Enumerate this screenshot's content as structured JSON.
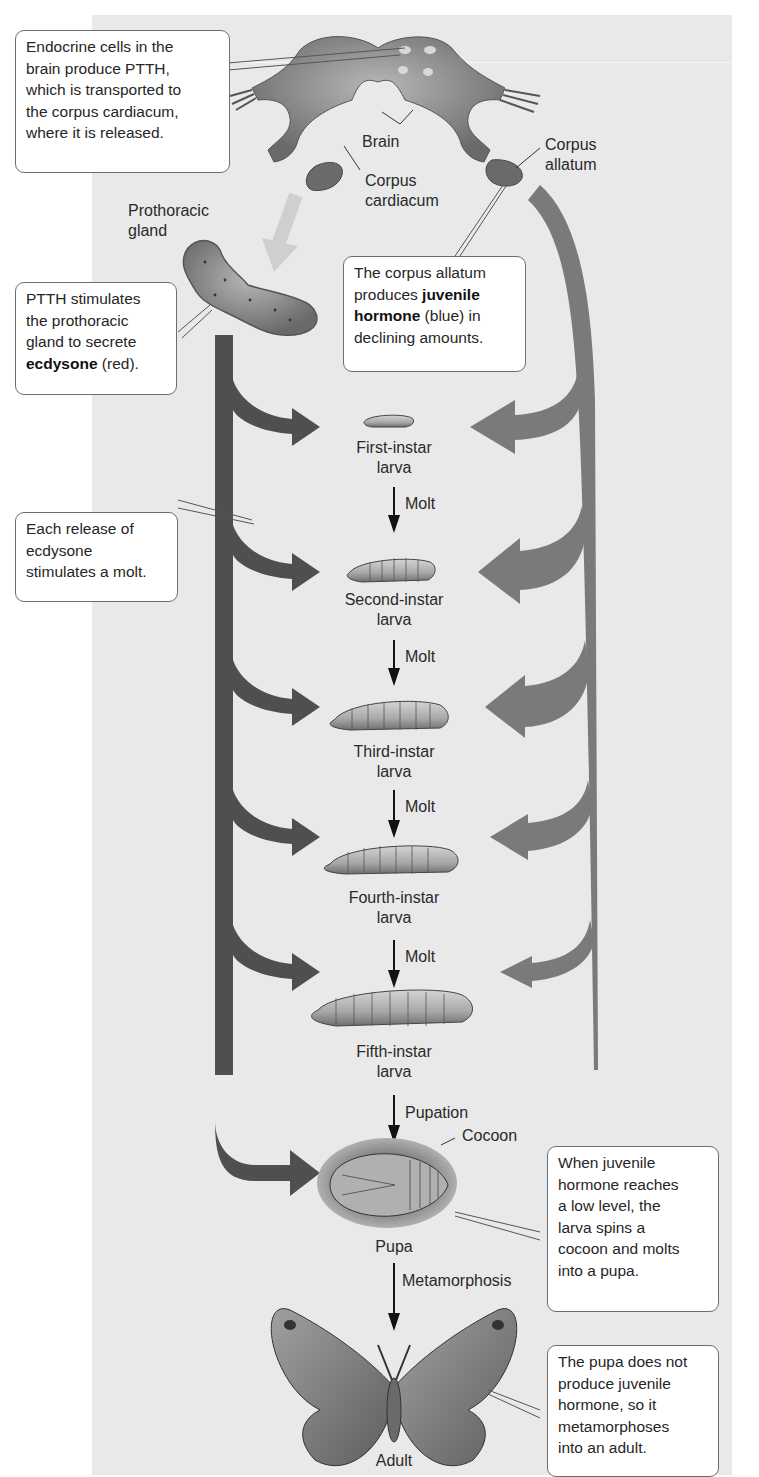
{
  "figure": {
    "topic": "Hormonal control of insect molting and metamorphosis",
    "colors": {
      "panel_background": "#e9e9e9",
      "ecdysone_arrow": "#4f4f4f",
      "juvenile_hormone_arrow": "#7a7a7a",
      "ptth_arrow": "#cfcfcf",
      "callout_border": "#6e6e6e",
      "text": "#262626"
    }
  },
  "anatomy_labels": {
    "brain": "Brain",
    "corpus_cardiacum": [
      "Corpus",
      "cardiacum"
    ],
    "corpus_allatum": [
      "Corpus",
      "allatum"
    ],
    "prothoracic_gland": [
      "Prothoracic",
      "gland"
    ]
  },
  "callouts": {
    "ptth_release": {
      "lines": [
        "Endocrine cells in the",
        "brain produce PTTH,",
        "which is transported to",
        "the corpus cardiacum,",
        "where it is released."
      ]
    },
    "juvenile_hormone": {
      "line1": "The corpus allatum",
      "line2_pre": "produces ",
      "line2_bold": "juvenile",
      "line3_bold": "hormone",
      "line3_post": " (blue) in",
      "line4": "declining amounts."
    },
    "ecdysone": {
      "line1": "PTTH stimulates",
      "line2": "the prothoracic",
      "line3": "gland to secrete",
      "line4_bold": "ecdysone",
      "line4_post": " (red)."
    },
    "molt_release": {
      "lines": [
        "Each release of",
        "ecdysone",
        "stimulates a molt."
      ]
    },
    "pupa": {
      "lines": [
        "When juvenile",
        "hormone reaches",
        "a low level, the",
        "larva spins a",
        "cocoon and molts",
        "into a pupa."
      ]
    },
    "adult": {
      "lines": [
        "The pupa does not",
        "produce juvenile",
        "hormone, so it",
        "metamorphoses",
        "into an adult."
      ]
    }
  },
  "stages": [
    {
      "name": [
        "First-instar",
        "larva"
      ]
    },
    {
      "name": [
        "Second-instar",
        "larva"
      ]
    },
    {
      "name": [
        "Third-instar",
        "larva"
      ]
    },
    {
      "name": [
        "Fourth-instar",
        "larva"
      ]
    },
    {
      "name": [
        "Fifth-instar",
        "larva"
      ]
    },
    {
      "name": [
        "Pupa"
      ]
    },
    {
      "name": [
        "Adult"
      ]
    }
  ],
  "transitions": [
    "Molt",
    "Molt",
    "Molt",
    "Molt",
    "Pupation",
    "Metamorphosis"
  ],
  "cocoon_label": "Cocoon"
}
